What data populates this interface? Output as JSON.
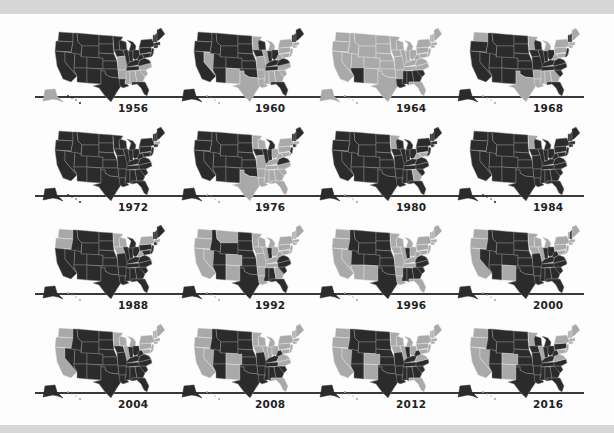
{
  "colors": {
    "republican": "#2b2b2b",
    "democrat": "#a9a9a9",
    "border_dark": "#8f8f8f",
    "border_light": "#e6e6e6",
    "timeline": "#3a3a3a",
    "frame": "#d6d6d6"
  },
  "chart_data": {
    "type": "map-small-multiples",
    "title": "",
    "legend": {
      "dark": "Republican",
      "light": "Democrat"
    },
    "years": [
      "1956",
      "1960",
      "1964",
      "1968",
      "1972",
      "1976",
      "1980",
      "1984",
      "1988",
      "1992",
      "1996",
      "2000",
      "2004",
      "2008",
      "2012",
      "2016"
    ],
    "dem_states": {
      "1956": [
        "MO",
        "AR",
        "MS",
        "AL",
        "GA",
        "SC",
        "NC",
        "AK"
      ],
      "1960": [
        "NV",
        "NM",
        "TX",
        "MN",
        "MO",
        "AR",
        "LA",
        "MS",
        "AL",
        "GA",
        "SC",
        "NC",
        "WV",
        "PA",
        "NY",
        "NJ",
        "MD",
        "DE",
        "MI",
        "IL",
        "CT",
        "RI",
        "MA",
        "HI"
      ],
      "1964": [
        "WA",
        "OR",
        "CA",
        "NV",
        "ID",
        "MT",
        "WY",
        "UT",
        "CO",
        "NM",
        "ND",
        "SD",
        "NE",
        "KS",
        "OK",
        "TX",
        "MN",
        "IA",
        "MO",
        "AR",
        "WI",
        "IL",
        "MI",
        "IN",
        "OH",
        "KY",
        "TN",
        "WV",
        "VA",
        "NC",
        "FL",
        "PA",
        "NY",
        "NJ",
        "MD",
        "DE",
        "CT",
        "RI",
        "MA",
        "VT",
        "NH",
        "ME",
        "AK",
        "HI"
      ],
      "1968": [
        "WA",
        "MN",
        "TX",
        "MI",
        "PA",
        "NY",
        "MA",
        "RI",
        "CT",
        "WV",
        "MD",
        "HI",
        "ME",
        "AR",
        "LA",
        "MS",
        "AL",
        "GA"
      ],
      "1972": [
        "MA"
      ],
      "1976": [
        "MN",
        "WI",
        "TX",
        "AR",
        "LA",
        "MS",
        "AL",
        "GA",
        "FL",
        "SC",
        "NC",
        "TN",
        "KY",
        "WV",
        "MO",
        "OH",
        "PA",
        "NY",
        "MD",
        "DE",
        "MA",
        "RI",
        "HI"
      ],
      "1980": [
        "MN",
        "GA",
        "WV",
        "MD",
        "RI",
        "HI"
      ],
      "1984": [
        "MN"
      ],
      "1988": [
        "WA",
        "OR",
        "MN",
        "IA",
        "WI",
        "WV",
        "NY",
        "MA",
        "RI",
        "HI"
      ],
      "1992": [
        "WA",
        "OR",
        "CA",
        "NV",
        "NM",
        "CO",
        "MT",
        "MN",
        "IA",
        "MO",
        "AR",
        "LA",
        "WI",
        "IL",
        "MI",
        "OH",
        "KY",
        "TN",
        "WV",
        "GA",
        "PA",
        "NY",
        "NJ",
        "MD",
        "DE",
        "CT",
        "RI",
        "MA",
        "VT",
        "NH",
        "ME",
        "HI"
      ],
      "1996": [
        "WA",
        "OR",
        "CA",
        "NV",
        "AZ",
        "NM",
        "MN",
        "IA",
        "MO",
        "AR",
        "LA",
        "WI",
        "IL",
        "MI",
        "OH",
        "KY",
        "TN",
        "WV",
        "FL",
        "PA",
        "NY",
        "NJ",
        "MD",
        "DE",
        "CT",
        "RI",
        "MA",
        "VT",
        "NH",
        "ME",
        "HI"
      ],
      "2000": [
        "WA",
        "OR",
        "CA",
        "NM",
        "MN",
        "IA",
        "WI",
        "IL",
        "MI",
        "PA",
        "NY",
        "NJ",
        "MD",
        "DE",
        "CT",
        "RI",
        "MA",
        "VT",
        "ME",
        "HI"
      ],
      "2004": [
        "WA",
        "OR",
        "CA",
        "MN",
        "WI",
        "IL",
        "MI",
        "PA",
        "NY",
        "NJ",
        "MD",
        "DE",
        "CT",
        "RI",
        "MA",
        "VT",
        "NH",
        "ME",
        "HI"
      ],
      "2008": [
        "WA",
        "OR",
        "CA",
        "NV",
        "CO",
        "NM",
        "MN",
        "IA",
        "WI",
        "IL",
        "MI",
        "IN",
        "OH",
        "PA",
        "NY",
        "NJ",
        "MD",
        "DE",
        "VA",
        "NC",
        "FL",
        "CT",
        "RI",
        "MA",
        "VT",
        "NH",
        "ME",
        "HI"
      ],
      "2012": [
        "WA",
        "OR",
        "CA",
        "NV",
        "CO",
        "NM",
        "MN",
        "IA",
        "WI",
        "IL",
        "MI",
        "OH",
        "PA",
        "NY",
        "NJ",
        "MD",
        "DE",
        "VA",
        "FL",
        "CT",
        "RI",
        "MA",
        "VT",
        "NH",
        "ME",
        "HI"
      ],
      "2016": [
        "WA",
        "OR",
        "CA",
        "NV",
        "CO",
        "NM",
        "MN",
        "IL",
        "VA",
        "NY",
        "NJ",
        "MD",
        "DE",
        "CT",
        "RI",
        "MA",
        "VT",
        "NH",
        "ME",
        "HI"
      ]
    }
  }
}
